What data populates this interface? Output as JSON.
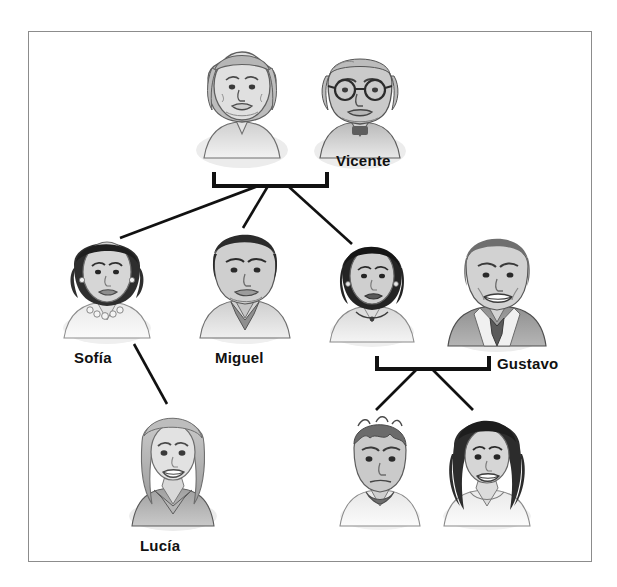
{
  "diagram": {
    "type": "family-tree",
    "frame": {
      "border_color": "#8c8c8c",
      "background": "#ffffff"
    },
    "line_color": "#111111",
    "label_color": "#111111",
    "people": [
      {
        "id": "grandmother",
        "label": "",
        "generation": 1,
        "role": "grandmother",
        "description": "elderly woman with long grey hair"
      },
      {
        "id": "vicente",
        "label": "Vicente",
        "generation": 1,
        "role": "grandfather",
        "description": "elderly bald man with round glasses"
      },
      {
        "id": "sofia",
        "label": "Sofía",
        "generation": 2,
        "role": "daughter",
        "description": "woman with short dark hair and pearl necklace"
      },
      {
        "id": "miguel",
        "label": "Miguel",
        "generation": 2,
        "role": "son",
        "description": "man with dark hair and collared shirt"
      },
      {
        "id": "esposa",
        "label": "",
        "generation": 2,
        "role": "daughter",
        "description": "woman with short black bob haircut"
      },
      {
        "id": "gustavo",
        "label": "Gustavo",
        "generation": 2,
        "role": "son-in-law",
        "description": "smiling man in suit and tie"
      },
      {
        "id": "lucia",
        "label": "Lucía",
        "generation": 3,
        "role": "granddaughter",
        "description": "young woman with long light hair"
      },
      {
        "id": "nieto",
        "label": "",
        "generation": 3,
        "role": "grandson",
        "description": "teenage boy with short dark hair"
      },
      {
        "id": "nieta",
        "label": "",
        "generation": 3,
        "role": "granddaughter",
        "description": "young woman with long wavy dark hair"
      }
    ],
    "brackets": [
      {
        "id": "grandparents-bracket",
        "parents": [
          "grandmother",
          "vicente"
        ],
        "children": [
          "sofia",
          "miguel",
          "esposa"
        ]
      },
      {
        "id": "parents-bracket",
        "parents": [
          "esposa",
          "gustavo"
        ],
        "children": [
          "nieto",
          "nieta"
        ]
      }
    ],
    "links": [
      {
        "from": "sofia",
        "to": "lucia"
      }
    ]
  }
}
